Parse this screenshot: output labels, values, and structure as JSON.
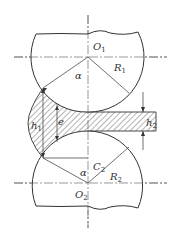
{
  "diagram": {
    "labels": {
      "o1": "O",
      "o1_sub": "1",
      "o2": "O",
      "o2_sub": "2",
      "r1": "R",
      "r1_sub": "1",
      "r2": "R",
      "r2_sub": "2",
      "alpha_top": "α",
      "alpha_bottom": "α",
      "c2": "C",
      "c2_sub": "2",
      "h1": "h",
      "h1_sub": "1",
      "h2": "h",
      "h2_sub": "2",
      "e": "e"
    },
    "colors": {
      "line": "#333333",
      "centerline": "#555555",
      "hatch": "#444444",
      "background": "#ffffff"
    }
  }
}
